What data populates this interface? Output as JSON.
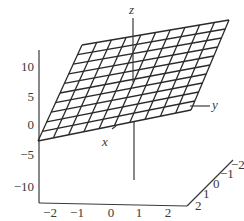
{
  "chart_data": {
    "type": "surface",
    "title": "",
    "grid": {
      "rows": 10,
      "cols": 10
    },
    "axes": {
      "x": {
        "label": "x",
        "ticks": [
          "-2",
          "-1",
          "0",
          "1",
          "2"
        ],
        "range": [
          -2,
          2
        ]
      },
      "y": {
        "label": "y",
        "ticks": [
          "2",
          "1",
          "0",
          "-1",
          "-2"
        ],
        "range": [
          -2,
          2
        ]
      },
      "z": {
        "label": "z",
        "ticks": [
          "10",
          "5",
          "0",
          "-5",
          "-10"
        ],
        "range": [
          -12,
          12
        ]
      }
    },
    "plane_corners_screen": {
      "top_left": [
        82,
        45
      ],
      "top_right": [
        229,
        20
      ],
      "bottom_right": [
        191,
        110
      ],
      "bottom_left": [
        38,
        141
      ]
    }
  },
  "labels": {
    "x": "x",
    "y": "y",
    "z": "z",
    "z_ticks": [
      "10",
      "5",
      "0",
      "−5",
      "−10"
    ],
    "x_ticks": [
      "−2",
      "−1",
      "0",
      "1",
      "2"
    ],
    "y_ticks": [
      "2",
      "1",
      "0",
      "−1",
      "−2"
    ]
  }
}
